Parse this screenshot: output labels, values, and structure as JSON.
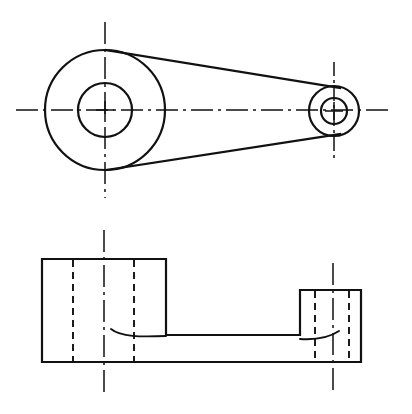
{
  "sheet": {
    "title": "Two-view orthographic engineering drawing of a crank arm / lever",
    "width": 412,
    "height": 414,
    "background_color": "#ffffff",
    "line_color": "#111111"
  },
  "views": [
    {
      "id": "top-view",
      "name": "Plan view (outline of lever)",
      "description": "Large circular boss joined by two straight tangent web lines to a small circular boss",
      "features": [
        {
          "id": "large-boss",
          "name": "large-boss",
          "type": "concentric-circles",
          "center": {
            "x": 105,
            "y": 110
          },
          "outer_radius": 60,
          "inner_radius": 27
        },
        {
          "id": "small-boss",
          "name": "small-boss",
          "type": "concentric-circles",
          "center": {
            "x": 334,
            "y": 111
          },
          "outer_radius": 25,
          "inner_radius": 13
        },
        {
          "id": "web-upper",
          "name": "upper-tangent-web-line",
          "type": "line",
          "from": {
            "x": 106,
            "y": 50
          },
          "to": {
            "x": 340,
            "y": 88
          }
        },
        {
          "id": "web-lower",
          "name": "lower-tangent-web-line",
          "type": "line",
          "from": {
            "x": 106,
            "y": 170
          },
          "to": {
            "x": 340,
            "y": 134
          }
        },
        {
          "id": "horizontal-centerline",
          "name": "horizontal-centerline",
          "type": "center-line",
          "from": {
            "x": 16,
            "y": 110
          },
          "to": {
            "x": 389,
            "y": 110
          }
        },
        {
          "id": "large-vertical-centerline",
          "name": "large-boss-vertical-centerline",
          "type": "center-line",
          "from": {
            "x": 105,
            "y": 22
          },
          "to": {
            "x": 105,
            "y": 198
          }
        },
        {
          "id": "small-vertical-centerline",
          "name": "small-boss-vertical-centerline",
          "type": "center-line",
          "from": {
            "x": 334,
            "y": 62
          },
          "to": {
            "x": 334,
            "y": 160
          }
        }
      ]
    },
    {
      "id": "front-view",
      "name": "Front elevation (section through lever)",
      "description": "Tall left block and shorter right block joined by a thin horizontal web, with hidden hole lines shown dashed",
      "features": [
        {
          "id": "left-block",
          "name": "left-boss-block",
          "type": "rectangle",
          "x": 42,
          "y": 259,
          "width": 124,
          "height": 103
        },
        {
          "id": "right-block",
          "name": "right-boss-block",
          "type": "rectangle",
          "x": 300,
          "y": 290,
          "width": 61,
          "height": 72
        },
        {
          "id": "web-slab",
          "name": "connecting-web-slab",
          "type": "rectangle",
          "x": 166,
          "y": 335,
          "width": 134,
          "height": 27
        },
        {
          "id": "left-hole-hidden-lines",
          "name": "left-hole-hidden-edges",
          "type": "hidden-lines",
          "x_positions": [
            73,
            134
          ],
          "from_y": 259,
          "to_y": 362
        },
        {
          "id": "right-hole-hidden-lines",
          "name": "right-hole-hidden-edges",
          "type": "hidden-lines",
          "x_positions": [
            315,
            349
          ],
          "from_y": 290,
          "to_y": 362
        },
        {
          "id": "left-fillet",
          "name": "left-fillet-curve",
          "type": "fillet",
          "from": {
            "x": 112,
            "y": 329
          },
          "to": {
            "x": 166,
            "y": 336
          }
        },
        {
          "id": "right-fillet",
          "name": "right-fillet-curve",
          "type": "fillet",
          "from": {
            "x": 300,
            "y": 338
          },
          "to": {
            "x": 338,
            "y": 332
          }
        },
        {
          "id": "left-vertical-centerline",
          "name": "left-block-vertical-centerline",
          "type": "center-line",
          "from": {
            "x": 104,
            "y": 230
          },
          "to": {
            "x": 104,
            "y": 392
          }
        },
        {
          "id": "right-vertical-centerline",
          "name": "right-block-vertical-centerline",
          "type": "center-line",
          "from": {
            "x": 333,
            "y": 263
          },
          "to": {
            "x": 333,
            "y": 390
          }
        }
      ]
    }
  ],
  "annotations": {
    "dimensions": [],
    "labels": [],
    "notes": []
  }
}
